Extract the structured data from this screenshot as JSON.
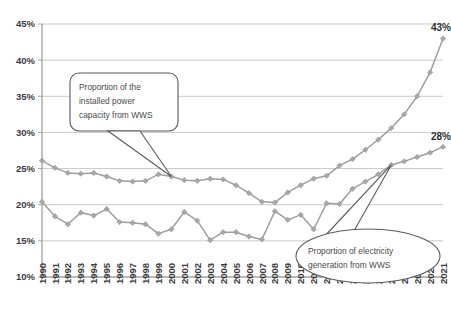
{
  "chart_data": {
    "type": "line",
    "title": "",
    "subtitle": "",
    "xlabel": "",
    "ylabel": "",
    "grid": true,
    "legend_position": "none",
    "ylim": [
      10,
      45
    ],
    "ytick_step": 5,
    "ytick_labels": [
      "10%",
      "15%",
      "20%",
      "25%",
      "30%",
      "35%",
      "40%",
      "45%"
    ],
    "ytick_values": [
      10,
      15,
      20,
      25,
      30,
      35,
      40,
      45
    ],
    "categories": [
      "1990",
      "1991",
      "1992",
      "1993",
      "1994",
      "1995",
      "1996",
      "1997",
      "1998",
      "1999",
      "2000",
      "2001",
      "2002",
      "2003",
      "2004",
      "2005",
      "2006",
      "2007",
      "2008",
      "2009",
      "2010",
      "2011",
      "2012",
      "2013",
      "2014",
      "2015",
      "2016",
      "2017",
      "2018",
      "2019",
      "2020",
      "2021"
    ],
    "series": [
      {
        "name": "Proportion of the installed power capacity from WWS",
        "color": "#9e9e9e",
        "values": [
          26.1,
          25.1,
          24.4,
          24.3,
          24.4,
          23.9,
          23.3,
          23.2,
          23.3,
          24.2,
          23.9,
          23.4,
          23.3,
          23.6,
          23.5,
          22.7,
          21.6,
          20.4,
          20.3,
          21.7,
          22.7,
          23.6,
          24.0,
          25.4,
          26.3,
          27.6,
          29.0,
          30.6,
          32.5,
          35.0,
          38.3,
          43.0
        ],
        "end_label": "43%"
      },
      {
        "name": "Proportion of electricity generation from WWS",
        "color": "#9e9e9e",
        "values": [
          20.4,
          18.4,
          17.3,
          18.9,
          18.5,
          19.4,
          17.6,
          17.5,
          17.3,
          16.0,
          16.6,
          19.0,
          17.8,
          15.1,
          16.2,
          16.2,
          15.6,
          15.2,
          19.1,
          17.9,
          18.6,
          16.6,
          20.2,
          20.1,
          22.2,
          23.2,
          24.2,
          25.5,
          26.0,
          26.6,
          27.2,
          28.0
        ],
        "end_label": "28%"
      }
    ],
    "annotations": [
      {
        "id": "callout-capacity",
        "shape": "rounded-rect",
        "lines": [
          "Proportion of the",
          "installed power",
          "capacity from WWS"
        ],
        "points_to_year": "2000",
        "points_to_series": "Proportion of the installed power capacity from WWS"
      },
      {
        "id": "callout-generation",
        "shape": "ellipse",
        "lines": [
          "Proportion of electricity",
          "generation from WWS"
        ],
        "points_to_year": "2017",
        "points_to_series": "Proportion of electricity generation from WWS"
      }
    ]
  }
}
